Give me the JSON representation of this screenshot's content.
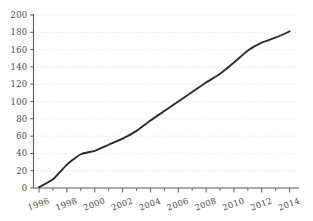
{
  "chart_data": {
    "type": "line",
    "title": "",
    "subtitle": "",
    "xlabel": "",
    "ylabel": "",
    "xlim": [
      1995.6,
      2014.6
    ],
    "ylim": [
      0,
      200
    ],
    "grid": true,
    "legend": false,
    "legend_position": "none",
    "line_color": "#2b2b2b",
    "grid_color": "#d8d8d8",
    "axis_color": "#5a5a5a",
    "label_color": "#4a4a4a",
    "background_color": "#ffffff",
    "y_ticks": [
      0,
      20,
      40,
      60,
      80,
      100,
      120,
      140,
      160,
      180,
      200
    ],
    "y_tick_labels": [
      "0",
      "20",
      "40",
      "60",
      "80",
      "100",
      "120",
      "140",
      "160",
      "180",
      "200"
    ],
    "x_ticks": [
      1996,
      1998,
      2000,
      2002,
      2004,
      2006,
      2008,
      2010,
      2012,
      2014
    ],
    "x_tick_labels": [
      "1996",
      "1998",
      "2000",
      "2002",
      "2004",
      "2006",
      "2008",
      "2010",
      "2012",
      "2014"
    ],
    "x_minor_ticks": [
      1997,
      1999,
      2001,
      2003,
      2005,
      2007,
      2009,
      2011,
      2013
    ],
    "x_tick_label_rotation": -20,
    "series": [
      {
        "name": "series-1",
        "x": [
          1996,
          1997,
          1998,
          1999,
          2000,
          2001,
          2002,
          2003,
          2004,
          2005,
          2006,
          2007,
          2008,
          2009,
          2010,
          2011,
          2012,
          2013,
          2014
        ],
        "values": [
          1,
          10,
          27,
          39,
          43,
          50,
          57,
          66,
          78,
          89,
          100,
          111,
          122,
          132,
          145,
          159,
          168,
          174,
          181
        ]
      }
    ]
  }
}
